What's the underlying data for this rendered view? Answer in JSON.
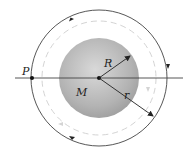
{
  "diagram": {
    "labels": {
      "point": "P",
      "sphere_radius": "R",
      "mass": "M",
      "orbit_radius": "r"
    },
    "colors": {
      "line": "#333333",
      "sphere_light": "#d6d6d6",
      "sphere_dark": "#9a9a9a",
      "dashed_orbit": "#d0d0d0"
    }
  }
}
